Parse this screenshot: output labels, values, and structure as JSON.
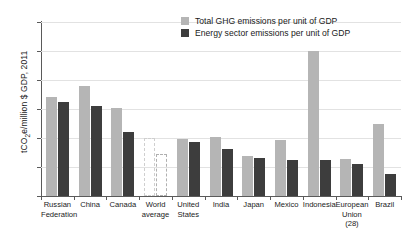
{
  "chart_data": {
    "type": "bar",
    "title": "",
    "xlabel": "",
    "ylabel_plain": "tCO2e/million $ GDP, 2011",
    "ylabel_prefix": "tCO",
    "ylabel_sub": "2",
    "ylabel_suffix": "e/million $ GDP, 2011",
    "ylim": [
      0,
      1200
    ],
    "yticks": [
      0,
      200,
      400,
      600,
      800,
      1000,
      1200
    ],
    "ytick_labels": [
      "0",
      "200",
      "400",
      "600",
      "800",
      "1000",
      "1200"
    ],
    "grid": true,
    "legend_position": "top-right",
    "categories": [
      "Russian Federation",
      "China",
      "Canada",
      "World average",
      "United States",
      "India",
      "Japan",
      "Mexico",
      "Indonesia",
      "European Union (28)",
      "Brazil"
    ],
    "category_lines": [
      [
        "Russian",
        "Federation"
      ],
      [
        "China"
      ],
      [
        "Canada"
      ],
      [
        "World",
        "average"
      ],
      [
        "United",
        "States"
      ],
      [
        "India"
      ],
      [
        "Japan"
      ],
      [
        "Mexico"
      ],
      [
        "Indonesia"
      ],
      [
        "European",
        "Union (28)"
      ],
      [
        "Brazil"
      ]
    ],
    "series": [
      {
        "name": "Total GHG emissions per unit of GDP",
        "color": "#b5b5b5",
        "values": [
          685,
          760,
          610,
          400,
          390,
          405,
          275,
          385,
          1000,
          255,
          500
        ]
      },
      {
        "name": "Energy sector emissions per unit of GDP",
        "color": "#3d3d3d",
        "values": [
          645,
          620,
          440,
          290,
          375,
          325,
          265,
          250,
          250,
          220,
          155
        ]
      }
    ],
    "outlined_categories": [
      "World average"
    ]
  },
  "legend": {
    "items": [
      {
        "label": "Total GHG emissions per unit of GDP",
        "swatch": "light"
      },
      {
        "label": "Energy sector emissions per unit of GDP",
        "swatch": "dark"
      }
    ]
  }
}
